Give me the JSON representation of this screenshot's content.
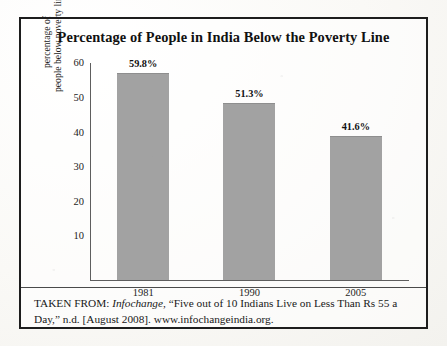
{
  "figure": {
    "title": "Percentage of People in India Below the Poverty Line",
    "source_prefix": "TAKEN FROM:",
    "source_publication": "Infochange",
    "source_rest": ", “Five out of 10 Indians Live on Less Than Rs 55 a Day,” n.d. [August 2008]. www.infochangeindia.org.",
    "border_color": "#1d1d1d",
    "bar_color": "#a2a2a2"
  },
  "chart_data": {
    "type": "bar",
    "title": "Percentage of People in India Below the Poverty Line",
    "categories": [
      "1981",
      "1990",
      "2005"
    ],
    "values": [
      59.8,
      51.3,
      41.6
    ],
    "value_labels": [
      "59.8%",
      "51.3%",
      "41.6%"
    ],
    "xlabel": "",
    "ylabel": "percentage of people below poverty line",
    "ylabel_line1": "percentage of",
    "ylabel_line2": "people below poverty line",
    "ylim": [
      0,
      63
    ],
    "yticks": [
      10,
      20,
      30,
      40,
      50,
      60
    ],
    "ytick_labels": [
      "10",
      "20",
      "30",
      "40",
      "50",
      "60"
    ],
    "grid": false,
    "legend": false,
    "series_color": "#a2a2a2"
  }
}
